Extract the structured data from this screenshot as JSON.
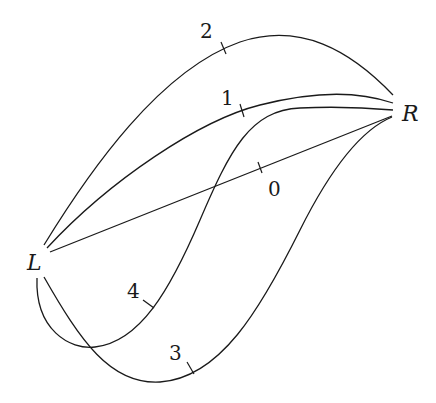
{
  "diagram": {
    "nodes": [
      {
        "id": "L",
        "label": "L",
        "x": 37,
        "y": 270
      },
      {
        "id": "R",
        "label": "R",
        "x": 412,
        "y": 121
      }
    ],
    "edges": [
      {
        "id": "0",
        "label": "0",
        "from": "L",
        "to": "R",
        "shape": "straight",
        "path": "M 50 252 L 392 116",
        "tick": {
          "x1": 258,
          "y1": 162,
          "x2": 262,
          "y2": 173
        },
        "label_pos": {
          "x": 268,
          "y": 196
        }
      },
      {
        "id": "1",
        "label": "1",
        "from": "L",
        "to": "R",
        "shape": "arc",
        "path": "M 47 248 C 110 180, 200 120, 260 105 C 320 90, 360 92, 393 103",
        "tick": {
          "x1": 240,
          "y1": 104,
          "x2": 244,
          "y2": 117
        },
        "label_pos": {
          "x": 221,
          "y": 105
        }
      },
      {
        "id": "2",
        "label": "2",
        "from": "L",
        "to": "R",
        "shape": "high-arc",
        "path": "M 44 245 C 90 170, 160 70, 240 42 C 300 22, 350 50, 393 95",
        "tick": {
          "x1": 221,
          "y1": 42,
          "x2": 226,
          "y2": 54
        },
        "label_pos": {
          "x": 200,
          "y": 38
        }
      },
      {
        "id": "3",
        "label": "3",
        "from": "L",
        "to": "R",
        "shape": "deep-loop",
        "path": "M 44 277 C 80 340, 110 385, 160 382 C 220 378, 260 310, 300 230 C 330 170, 360 130, 392 117",
        "tick": {
          "x1": 187,
          "y1": 362,
          "x2": 194,
          "y2": 374
        },
        "label_pos": {
          "x": 169,
          "y": 360
        }
      },
      {
        "id": "4",
        "label": "4",
        "from": "L",
        "to": "R",
        "shape": "s-loop",
        "path": "M 37 278 C 35 330, 70 350, 95 347 C 140 342, 170 290, 200 220 C 230 150, 250 110, 300 108 C 340 106, 370 108, 393 110",
        "tick": {
          "x1": 143,
          "y1": 300,
          "x2": 154,
          "y2": 308
        },
        "label_pos": {
          "x": 127,
          "y": 298
        }
      }
    ]
  }
}
